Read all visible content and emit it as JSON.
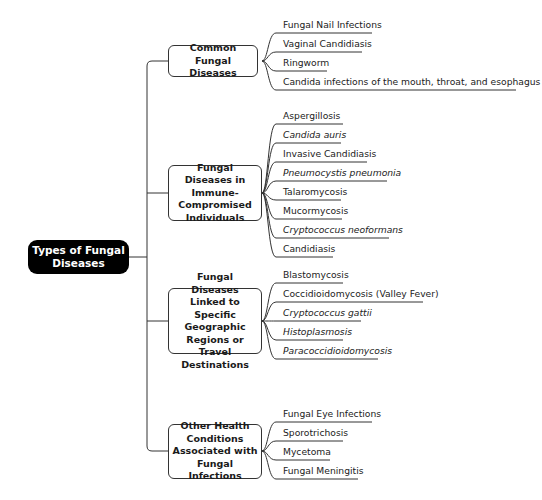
{
  "root": {
    "label": "Types of Fungal Diseases"
  },
  "categories": [
    {
      "label": "Common Fungal Diseases",
      "items": [
        {
          "label": "Fungal Nail Infections",
          "italic": false
        },
        {
          "label": "Vaginal Candidiasis",
          "italic": false
        },
        {
          "label": "Ringworm",
          "italic": false
        },
        {
          "label": "Candida infections of the mouth, throat, and esophagus",
          "italic": false
        }
      ]
    },
    {
      "label": "Fungal Diseases in Immune-Compromised Individuals",
      "items": [
        {
          "label": "Aspergillosis",
          "italic": false
        },
        {
          "label": "Candida auris",
          "italic": true
        },
        {
          "label": "Invasive Candidiasis",
          "italic": false
        },
        {
          "label": "Pneumocystis pneumonia",
          "italic": true
        },
        {
          "label": "Talaromycosis",
          "italic": false
        },
        {
          "label": "Mucormycosis",
          "italic": false
        },
        {
          "label": "Cryptococcus neoformans",
          "italic": true
        },
        {
          "label": "Candidiasis",
          "italic": false
        }
      ]
    },
    {
      "label": "Fungal Diseases Linked to Specific Geographic Regions or Travel Destinations",
      "items": [
        {
          "label": "Blastomycosis",
          "italic": false
        },
        {
          "label": "Coccidioidomycosis (Valley Fever)",
          "italic": false
        },
        {
          "label": "Cryptococcus gattii",
          "italic": true
        },
        {
          "label": "Histoplasmosis",
          "italic": true
        },
        {
          "label": "Paracoccidioidomycosis",
          "italic": true
        }
      ]
    },
    {
      "label": "Other Health Conditions Associated with Fungal Infections",
      "items": [
        {
          "label": "Fungal Eye Infections",
          "italic": false
        },
        {
          "label": "Sporotrichosis",
          "italic": false
        },
        {
          "label": "Mycetoma",
          "italic": false
        },
        {
          "label": "Fungal Meningitis",
          "italic": false
        }
      ]
    }
  ],
  "colors": {
    "root_bg": "#000000",
    "root_text": "#ffffff",
    "line": "#333333",
    "box_border": "#333333"
  }
}
